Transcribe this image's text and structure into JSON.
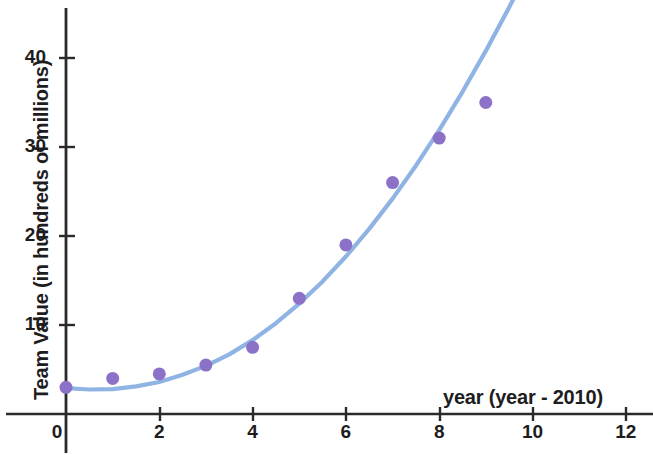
{
  "chart_data": {
    "type": "scatter",
    "title": "",
    "xlabel": "year (year - 2010)",
    "ylabel": "Team Value (in hundreds of millions)",
    "xlim": [
      -1.3,
      12.6
    ],
    "ylim": [
      -1.0,
      46.5
    ],
    "xticks": [
      0,
      2,
      4,
      6,
      8,
      10,
      12
    ],
    "xtick_labels": [
      "0",
      "2",
      "4",
      "6",
      "8",
      "10",
      "12"
    ],
    "yticks": [
      10,
      20,
      30,
      40
    ],
    "ytick_labels": [
      "10",
      "20",
      "30",
      "40"
    ],
    "grid": false,
    "legend": "none",
    "x": [
      0,
      1,
      2,
      3,
      4,
      5,
      6,
      7,
      8,
      9
    ],
    "values": [
      3,
      4,
      4.5,
      5.5,
      7.5,
      13,
      19,
      26,
      31,
      35
    ],
    "series": [
      {
        "name": "Team Value data points",
        "type": "scatter",
        "color": "#8b72c8",
        "marker": "circle",
        "marker_size": 13,
        "x": [
          0,
          1,
          2,
          3,
          4,
          5,
          6,
          7,
          8,
          9
        ],
        "values": [
          3,
          4,
          4.5,
          5.5,
          7.5,
          13,
          19,
          26,
          31,
          35
        ]
      },
      {
        "name": "fitted curve",
        "type": "line",
        "color": "#8fb4e3",
        "line_width": 4,
        "x": [
          0,
          0.5,
          1,
          1.5,
          2,
          2.5,
          3,
          3.5,
          4,
          4.5,
          5,
          5.5,
          6,
          6.5,
          7,
          7.5,
          8,
          8.5,
          9,
          9.5,
          10,
          10.1
        ],
        "values": [
          2.9,
          2.75,
          2.8,
          3.1,
          3.6,
          4.4,
          5.4,
          6.7,
          8.3,
          10.2,
          12.4,
          14.9,
          17.7,
          20.8,
          24.2,
          27.9,
          31.9,
          36.2,
          40.8,
          45.7,
          50.9,
          52.0
        ]
      }
    ],
    "colors": {
      "point_fill": "#8b72c8",
      "curve": "#8fb4e3",
      "axis": "#2a2a2a",
      "text": "#1d1d1d",
      "background": "#ffffff"
    }
  },
  "axes": {
    "x_axis_name": "year (year - 2010)",
    "y_axis_name": "Team Value (in hundreds of millions)"
  }
}
